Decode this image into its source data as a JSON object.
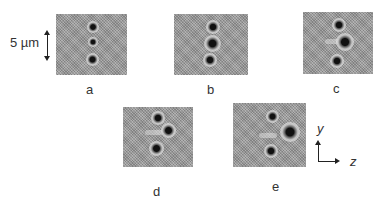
{
  "scale_bar": {
    "label": "5 µm"
  },
  "panels": [
    {
      "id": "a",
      "label": "a"
    },
    {
      "id": "b",
      "label": "b"
    },
    {
      "id": "c",
      "label": "c"
    },
    {
      "id": "d",
      "label": "d"
    },
    {
      "id": "e",
      "label": "e"
    }
  ],
  "axes": {
    "vertical": "y",
    "horizontal": "z"
  },
  "colors": {
    "panel_gray": "#9c9c9c",
    "bead_core": "#111111",
    "text": "#333333"
  }
}
